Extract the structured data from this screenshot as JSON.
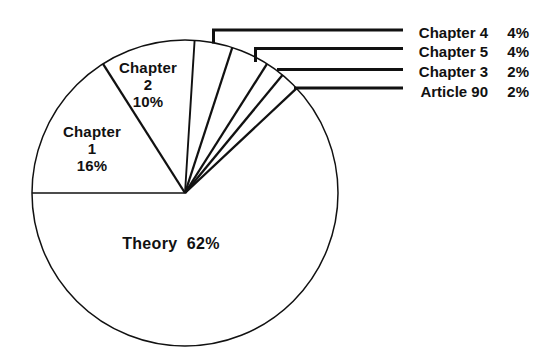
{
  "chart_data": {
    "type": "pie",
    "title": "",
    "unit": "%",
    "start_angle_deg": 180,
    "direction": "clockwise",
    "fill_style": "outline-only",
    "legend_position": "none",
    "slices": [
      {
        "label": "Chapter 1",
        "value": 16,
        "pct_text": "16%",
        "label_placement": "inside",
        "display_lines": [
          "Chapter",
          "1",
          "16%"
        ]
      },
      {
        "label": "Chapter 2",
        "value": 10,
        "pct_text": "10%",
        "label_placement": "inside",
        "display_lines": [
          "Chapter",
          "2",
          "10%"
        ]
      },
      {
        "label": "Chapter 4",
        "value": 4,
        "pct_text": "4%",
        "label_placement": "callout"
      },
      {
        "label": "Chapter 5",
        "value": 4,
        "pct_text": "4%",
        "label_placement": "callout"
      },
      {
        "label": "Chapter 3",
        "value": 2,
        "pct_text": "2%",
        "label_placement": "callout"
      },
      {
        "label": "Article 90",
        "value": 2,
        "pct_text": "2%",
        "label_placement": "callout"
      },
      {
        "label": "Theory",
        "value": 62,
        "pct_text": "62%",
        "label_placement": "inside",
        "display": "Theory  62%"
      }
    ],
    "colors": {
      "ink": "#111111",
      "background": "#ffffff"
    }
  }
}
